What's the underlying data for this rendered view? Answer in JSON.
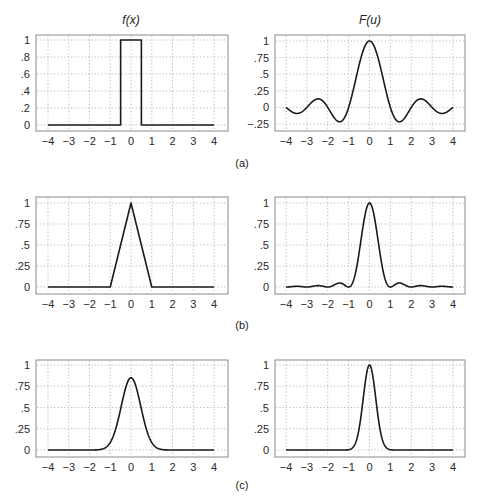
{
  "figure": {
    "titles": {
      "left": "f(x)",
      "right": "F(u)"
    },
    "panel_labels": [
      "(a)",
      "(b)",
      "(c)"
    ],
    "colors": {
      "line": "#1a1a1a",
      "frame": "#8a8a8a",
      "grid": "#a8a8a8"
    }
  },
  "chart_data": [
    {
      "id": "a-left",
      "type": "line",
      "title": "f(x)",
      "panel": "(a)",
      "description": "rectangular pulse",
      "xlim": [
        -4,
        4
      ],
      "ylim": [
        0,
        1
      ],
      "xticks": [
        -4,
        -3,
        -2,
        -1,
        0,
        1,
        2,
        3,
        4
      ],
      "xticklabels": [
        "−4",
        "−3",
        "−2",
        "−1",
        "0",
        "1",
        "2",
        "3",
        "4"
      ],
      "yticks": [
        0,
        0.2,
        0.4,
        0.6,
        0.8,
        1
      ],
      "yticklabels": [
        "0",
        ".2",
        ".4",
        ".6",
        ".8",
        "1"
      ],
      "grid": true,
      "x": [
        -4,
        -0.5,
        -0.5,
        0.5,
        0.5,
        4
      ],
      "y": [
        0,
        0,
        1,
        1,
        0,
        0
      ]
    },
    {
      "id": "a-right",
      "type": "line",
      "title": "F(u)",
      "panel": "(a)",
      "description": "sinc(u) = sin(pi u)/(pi u)",
      "xlim": [
        -4,
        4
      ],
      "ylim": [
        -0.25,
        1
      ],
      "xticks": [
        -4,
        -3,
        -2,
        -1,
        0,
        1,
        2,
        3,
        4
      ],
      "xticklabels": [
        "−4",
        "−3",
        "−2",
        "−1",
        "0",
        "1",
        "2",
        "3",
        "4"
      ],
      "yticks": [
        -0.25,
        0,
        0.25,
        0.5,
        0.75,
        1
      ],
      "yticklabels": [
        "−.25",
        "0",
        ".25",
        ".5",
        ".75",
        "1"
      ],
      "grid": true,
      "x": [
        -4,
        -3.5,
        -3,
        -2.5,
        -2,
        -1.5,
        -1,
        -0.5,
        0,
        0.5,
        1,
        1.5,
        2,
        2.5,
        3,
        3.5,
        4
      ],
      "y": [
        0,
        -0.091,
        0,
        0.127,
        0,
        -0.212,
        0,
        0.637,
        1,
        0.637,
        0,
        -0.212,
        0,
        0.127,
        0,
        -0.091,
        0
      ]
    },
    {
      "id": "b-left",
      "type": "line",
      "title": "",
      "panel": "(b)",
      "description": "triangular pulse",
      "xlim": [
        -4,
        4
      ],
      "ylim": [
        0,
        1
      ],
      "xticks": [
        -4,
        -3,
        -2,
        -1,
        0,
        1,
        2,
        3,
        4
      ],
      "xticklabels": [
        "−4",
        "−3",
        "−2",
        "−1",
        "0",
        "1",
        "2",
        "3",
        "4"
      ],
      "yticks": [
        0,
        0.25,
        0.5,
        0.75,
        1
      ],
      "yticklabels": [
        "0",
        ".25",
        ".5",
        ".75",
        "1"
      ],
      "grid": true,
      "x": [
        -4,
        -1,
        0,
        1,
        4
      ],
      "y": [
        0,
        0,
        1,
        0,
        0
      ]
    },
    {
      "id": "b-right",
      "type": "line",
      "title": "",
      "panel": "(b)",
      "description": "sinc^2(u)",
      "xlim": [
        -4,
        4
      ],
      "ylim": [
        0,
        1
      ],
      "xticks": [
        -4,
        -3,
        -2,
        -1,
        0,
        1,
        2,
        3,
        4
      ],
      "xticklabels": [
        "−4",
        "−3",
        "−2",
        "−1",
        "0",
        "1",
        "2",
        "3",
        "4"
      ],
      "yticks": [
        0,
        0.25,
        0.5,
        0.75,
        1
      ],
      "yticklabels": [
        "0",
        ".25",
        ".5",
        ".75",
        "1"
      ],
      "grid": true,
      "x": [
        -4,
        -3.5,
        -3,
        -2.5,
        -2,
        -1.5,
        -1,
        -0.5,
        0,
        0.5,
        1,
        1.5,
        2,
        2.5,
        3,
        3.5,
        4
      ],
      "y": [
        0,
        0.008,
        0,
        0.016,
        0,
        0.045,
        0,
        0.405,
        1,
        0.405,
        0,
        0.045,
        0,
        0.016,
        0,
        0.008,
        0
      ]
    },
    {
      "id": "c-left",
      "type": "line",
      "title": "",
      "panel": "(c)",
      "description": "Gaussian, peak ~0.85",
      "xlim": [
        -4,
        4
      ],
      "ylim": [
        0,
        1
      ],
      "xticks": [
        -4,
        -3,
        -2,
        -1,
        0,
        1,
        2,
        3,
        4
      ],
      "xticklabels": [
        "−4",
        "−3",
        "−2",
        "−1",
        "0",
        "1",
        "2",
        "3",
        "4"
      ],
      "yticks": [
        0,
        0.25,
        0.5,
        0.75,
        1
      ],
      "yticklabels": [
        "0",
        ".25",
        ".5",
        ".75",
        "1"
      ],
      "grid": true,
      "x": [
        -4,
        -2,
        -1.5,
        -1,
        -0.5,
        0,
        0.5,
        1,
        1.5,
        2,
        4
      ],
      "y": [
        0,
        0.001,
        0.007,
        0.09,
        0.48,
        0.85,
        0.48,
        0.09,
        0.007,
        0.001,
        0
      ]
    },
    {
      "id": "c-right",
      "type": "line",
      "title": "",
      "panel": "(c)",
      "description": "Gaussian, peak 1 (narrower)",
      "xlim": [
        -4,
        4
      ],
      "ylim": [
        0,
        1
      ],
      "xticks": [
        -4,
        -3,
        -2,
        -1,
        0,
        1,
        2,
        3,
        4
      ],
      "xticklabels": [
        "−4",
        "−3",
        "−2",
        "−1",
        "0",
        "1",
        "2",
        "3",
        "4"
      ],
      "yticks": [
        0,
        0.25,
        0.5,
        0.75,
        1
      ],
      "yticklabels": [
        "0",
        ".25",
        ".5",
        ".75",
        "1"
      ],
      "grid": true,
      "x": [
        -4,
        -1,
        -0.75,
        -0.5,
        -0.25,
        0,
        0.25,
        0.5,
        0.75,
        1,
        4
      ],
      "y": [
        0,
        0.004,
        0.044,
        0.25,
        0.71,
        1,
        0.71,
        0.25,
        0.044,
        0.004,
        0
      ]
    }
  ]
}
